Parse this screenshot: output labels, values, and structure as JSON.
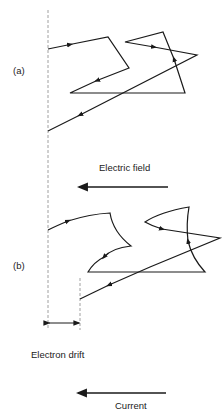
{
  "diagram": {
    "panel_a": {
      "label": "(a)"
    },
    "panel_b": {
      "label": "(b)"
    },
    "electric_field": {
      "label": "Electric field",
      "direction": "left"
    },
    "electron_drift": {
      "label": "Electron drift"
    },
    "current": {
      "label": "Current",
      "direction": "left"
    },
    "colors": {
      "line": "#1a1a1a",
      "dashed": "#888888",
      "background": "#ffffff"
    }
  }
}
